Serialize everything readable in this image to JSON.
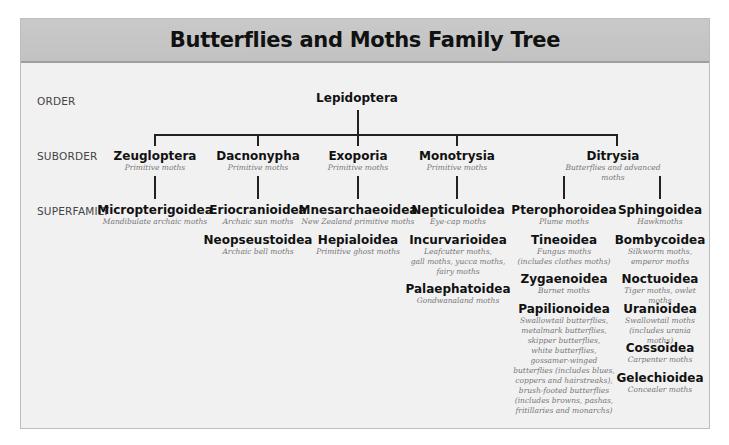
{
  "title": "Butterflies and Moths Family Tree",
  "ranks": {
    "order": "ORDER",
    "suborder": "SUBORDER",
    "superfamily": "SUPERFAMILY"
  },
  "order": {
    "name": "Lepidoptera"
  },
  "suborders": [
    {
      "name": "Zeugloptera",
      "desc": "Primitive moths"
    },
    {
      "name": "Dacnonypha",
      "desc": "Primitive moths"
    },
    {
      "name": "Exoporia",
      "desc": "Primitive moths"
    },
    {
      "name": "Monotrysia",
      "desc": "Primitive moths"
    },
    {
      "name": "Ditrysia",
      "desc": "Butterflies and advanced moths"
    }
  ],
  "superfamilies": {
    "zeugloptera": [
      {
        "name": "Micropterigoidea",
        "desc": "Mandibulate archaic moths"
      }
    ],
    "dacnonypha": [
      {
        "name": "Eriocranioidea",
        "desc": "Archaic sun moths"
      },
      {
        "name": "Neopseustoidea",
        "desc": "Archaic bell moths"
      }
    ],
    "exoporia": [
      {
        "name": "Mnesarchaeoidea",
        "desc": "New Zealand primitive moths"
      },
      {
        "name": "Hepialoidea",
        "desc": "Primitive ghost moths"
      }
    ],
    "monotrysia": [
      {
        "name": "Nepticuloidea",
        "desc": "Eye-cap moths"
      },
      {
        "name": "Incurvarioidea",
        "desc": "Leafcutter moths,\ngall moths, yucca moths,\nfairy moths"
      },
      {
        "name": "Palaephatoidea",
        "desc": "Gondwanaland moths"
      }
    ],
    "ditrysia_left": [
      {
        "name": "Pterophoroidea",
        "desc": "Plume moths"
      },
      {
        "name": "Tineoidea",
        "desc": "Fungus moths\n(includes clothes moths)"
      },
      {
        "name": "Zygaenoidea",
        "desc": "Burnet moths"
      },
      {
        "name": "Papilionoidea",
        "desc": "Swallowtail butterflies,\nmetalmark butterflies,\nskipper butterflies,\nwhite butterflies,\ngossamer-winged\nbutterflies (includes blues,\ncoppers and hairstreaks),\nbrush-footed butterflies\n(includes browns, pashas,\nfritillaries and monarchs)"
      }
    ],
    "ditrysia_right": [
      {
        "name": "Sphingoidea",
        "desc": "Hawkmoths"
      },
      {
        "name": "Bombycoidea",
        "desc": "Silkworm moths,\nemperor moths"
      },
      {
        "name": "Noctuoidea",
        "desc": "Tiger moths, owlet moths"
      },
      {
        "name": "Uranioidea",
        "desc": "Swallowtail moths\n(includes urania moths)"
      },
      {
        "name": "Cossoidea",
        "desc": "Carpenter moths"
      },
      {
        "name": "Gelechioidea",
        "desc": "Concealer moths"
      }
    ]
  },
  "colors": {
    "header_bg": "#c6c6c6",
    "panel_bg": "#f1f1f1",
    "line": "#222222"
  }
}
